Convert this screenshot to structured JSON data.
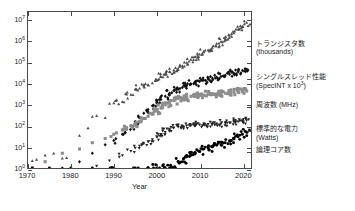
{
  "chart_data": {
    "type": "scatter",
    "title": "",
    "xlabel": "Year",
    "ylabel": "",
    "xlim": [
      1970,
      2022
    ],
    "ylim_log10": [
      0,
      7.4
    ],
    "grid": false,
    "legend_position": "right",
    "x_ticks": [
      1970,
      1980,
      1990,
      2000,
      2010,
      2020
    ],
    "y_ticks": [
      "10⁰",
      "10¹",
      "10²",
      "10³",
      "10⁴",
      "10⁵",
      "10⁶",
      "10⁷"
    ],
    "y_tick_exponents": [
      0,
      1,
      2,
      3,
      4,
      5,
      6,
      7
    ],
    "series": [
      {
        "name": "transistors",
        "label_line1": "トランジスタ数",
        "label_line2": "(thousands)",
        "marker": "triangle-up",
        "color": "#4d4d4d",
        "legend_y_frac": 0.215,
        "points": [
          [
            1971,
            0.34
          ],
          [
            1972,
            0.4
          ],
          [
            1974,
            0.6
          ],
          [
            1976,
            0.7
          ],
          [
            1978,
            0.46
          ],
          [
            1979,
            0.48
          ],
          [
            1982,
            1.54
          ],
          [
            1984,
            1.9
          ],
          [
            1985,
            2.44
          ],
          [
            1986,
            2.48
          ],
          [
            1988,
            2.38
          ],
          [
            1989,
            3.06
          ],
          [
            1990,
            3.08
          ],
          [
            1992,
            3.14
          ],
          [
            1993,
            3.5
          ],
          [
            1994,
            3.48
          ],
          [
            1995,
            3.75
          ],
          [
            1996,
            3.78
          ],
          [
            1997,
            3.88
          ],
          [
            1998,
            3.95
          ],
          [
            1999,
            4.03
          ],
          [
            2000,
            4.15
          ],
          [
            2001,
            4.33
          ],
          [
            2002,
            4.45
          ],
          [
            2003,
            4.58
          ],
          [
            2004,
            4.65
          ],
          [
            2005,
            4.72
          ],
          [
            2006,
            4.85
          ],
          [
            2007,
            5.0
          ],
          [
            2008,
            5.15
          ],
          [
            2009,
            5.28
          ],
          [
            2010,
            5.4
          ],
          [
            2011,
            5.5
          ],
          [
            2012,
            5.6
          ],
          [
            2013,
            5.72
          ],
          [
            2014,
            5.9
          ],
          [
            2015,
            6.0
          ],
          [
            2016,
            6.12
          ],
          [
            2017,
            6.28
          ],
          [
            2018,
            6.4
          ],
          [
            2019,
            6.58
          ],
          [
            2020,
            6.72
          ],
          [
            2021,
            6.9
          ]
        ]
      },
      {
        "name": "single-thread-performance",
        "label_line1": "シングルスレッド性能",
        "label_line2": "(SpecINT x 10³)",
        "marker": "diamond",
        "color": "#111111",
        "legend_y_frac": 0.425,
        "points": [
          [
            1978,
            0.0
          ],
          [
            1982,
            0.3
          ],
          [
            1985,
            0.7
          ],
          [
            1988,
            1.1
          ],
          [
            1990,
            1.3
          ],
          [
            1992,
            1.6
          ],
          [
            1993,
            1.85
          ],
          [
            1994,
            2.0
          ],
          [
            1995,
            2.2
          ],
          [
            1996,
            2.4
          ],
          [
            1997,
            2.6
          ],
          [
            1998,
            2.78
          ],
          [
            1999,
            2.95
          ],
          [
            2000,
            3.1
          ],
          [
            2001,
            3.25
          ],
          [
            2002,
            3.4
          ],
          [
            2003,
            3.55
          ],
          [
            2004,
            3.68
          ],
          [
            2005,
            3.74
          ],
          [
            2006,
            3.82
          ],
          [
            2007,
            3.9
          ],
          [
            2008,
            3.98
          ],
          [
            2009,
            4.04
          ],
          [
            2010,
            4.1
          ],
          [
            2011,
            4.16
          ],
          [
            2012,
            4.22
          ],
          [
            2013,
            4.26
          ],
          [
            2014,
            4.3
          ],
          [
            2015,
            4.34
          ],
          [
            2016,
            4.4
          ],
          [
            2017,
            4.45
          ],
          [
            2018,
            4.5
          ],
          [
            2019,
            4.56
          ],
          [
            2020,
            4.62
          ],
          [
            2021,
            4.68
          ]
        ]
      },
      {
        "name": "frequency",
        "label_line1": "周波数 (MHz)",
        "label_line2": "",
        "marker": "square",
        "color": "#8c8c8c",
        "legend_y_frac": 0.6,
        "points": [
          [
            1971,
            0.0
          ],
          [
            1974,
            0.3
          ],
          [
            1978,
            0.7
          ],
          [
            1982,
            0.9
          ],
          [
            1985,
            1.2
          ],
          [
            1988,
            1.4
          ],
          [
            1990,
            1.6
          ],
          [
            1992,
            1.8
          ],
          [
            1993,
            1.9
          ],
          [
            1994,
            2.0
          ],
          [
            1995,
            2.1
          ],
          [
            1996,
            2.2
          ],
          [
            1997,
            2.35
          ],
          [
            1998,
            2.45
          ],
          [
            1999,
            2.55
          ],
          [
            2000,
            2.7
          ],
          [
            2001,
            2.85
          ],
          [
            2002,
            3.0
          ],
          [
            2003,
            3.1
          ],
          [
            2004,
            3.2
          ],
          [
            2005,
            3.3
          ],
          [
            2006,
            3.3
          ],
          [
            2007,
            3.35
          ],
          [
            2008,
            3.4
          ],
          [
            2009,
            3.4
          ],
          [
            2010,
            3.45
          ],
          [
            2011,
            3.45
          ],
          [
            2012,
            3.5
          ],
          [
            2013,
            3.5
          ],
          [
            2014,
            3.5
          ],
          [
            2015,
            3.52
          ],
          [
            2016,
            3.55
          ],
          [
            2017,
            3.58
          ],
          [
            2018,
            3.6
          ],
          [
            2019,
            3.6
          ],
          [
            2020,
            3.62
          ],
          [
            2021,
            3.65
          ]
        ]
      },
      {
        "name": "typical-power",
        "label_line1": "標準的な電力",
        "label_line2": "(Watts)",
        "marker": "triangle-down",
        "color": "#222222",
        "legend_y_frac": 0.755,
        "points": [
          [
            1986,
            0.1
          ],
          [
            1989,
            0.35
          ],
          [
            1992,
            0.6
          ],
          [
            1994,
            0.8
          ],
          [
            1995,
            0.95
          ],
          [
            1996,
            1.05
          ],
          [
            1997,
            1.15
          ],
          [
            1998,
            1.25
          ],
          [
            1999,
            1.35
          ],
          [
            2000,
            1.48
          ],
          [
            2001,
            1.6
          ],
          [
            2002,
            1.7
          ],
          [
            2003,
            1.8
          ],
          [
            2004,
            1.9
          ],
          [
            2005,
            1.95
          ],
          [
            2006,
            1.98
          ],
          [
            2007,
            2.0
          ],
          [
            2008,
            2.02
          ],
          [
            2009,
            2.02
          ],
          [
            2010,
            2.05
          ],
          [
            2011,
            2.05
          ],
          [
            2012,
            2.08
          ],
          [
            2013,
            2.08
          ],
          [
            2014,
            2.1
          ],
          [
            2015,
            2.1
          ],
          [
            2016,
            2.12
          ],
          [
            2017,
            2.15
          ],
          [
            2018,
            2.18
          ],
          [
            2019,
            2.2
          ],
          [
            2020,
            2.22
          ],
          [
            2021,
            2.25
          ]
        ]
      },
      {
        "name": "logical-cores",
        "label_line1": "論理コア数",
        "label_line2": "",
        "marker": "dot",
        "color": "#000000",
        "legend_y_frac": 0.885,
        "points": [
          [
            1971,
            0
          ],
          [
            1975,
            0
          ],
          [
            1980,
            0
          ],
          [
            1985,
            0
          ],
          [
            1990,
            0
          ],
          [
            1995,
            0
          ],
          [
            1998,
            0
          ],
          [
            2000,
            0
          ],
          [
            2002,
            0
          ],
          [
            2003,
            0
          ],
          [
            2004,
            0
          ],
          [
            2005,
            0.3
          ],
          [
            2006,
            0.3
          ],
          [
            2007,
            0.6
          ],
          [
            2008,
            0.6
          ],
          [
            2009,
            0.7
          ],
          [
            2010,
            0.78
          ],
          [
            2011,
            0.9
          ],
          [
            2012,
            0.95
          ],
          [
            2013,
            1.0
          ],
          [
            2014,
            1.08
          ],
          [
            2015,
            1.1
          ],
          [
            2016,
            1.2
          ],
          [
            2017,
            1.3
          ],
          [
            2018,
            1.4
          ],
          [
            2019,
            1.48
          ],
          [
            2020,
            1.6
          ],
          [
            2021,
            1.7
          ]
        ]
      }
    ]
  },
  "axes": {
    "x_title": "Year"
  }
}
